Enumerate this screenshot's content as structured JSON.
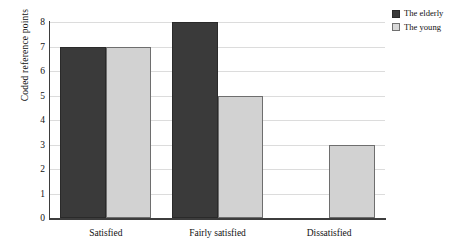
{
  "chart_data": {
    "type": "bar",
    "title": "",
    "xlabel": "",
    "ylabel": "Coded reference points",
    "categories": [
      "Satisfied",
      "Fairly satisfied",
      "Dissatisfied"
    ],
    "series": [
      {
        "name": "The elderly",
        "color": "#3a3a3a",
        "values": [
          7,
          8,
          0
        ]
      },
      {
        "name": "The young",
        "color": "#d2d2d2",
        "values": [
          7,
          5,
          3
        ]
      }
    ],
    "ylim": [
      0,
      8
    ],
    "yticks": [
      "0",
      "1",
      "2",
      "3",
      "4",
      "5",
      "6",
      "7",
      "8"
    ],
    "grid": true,
    "legend_position": "top-right"
  },
  "legend": {
    "entries": [
      {
        "label": "The elderly"
      },
      {
        "label": "The young"
      }
    ]
  },
  "axes": {
    "y_title": "Coded reference points"
  }
}
